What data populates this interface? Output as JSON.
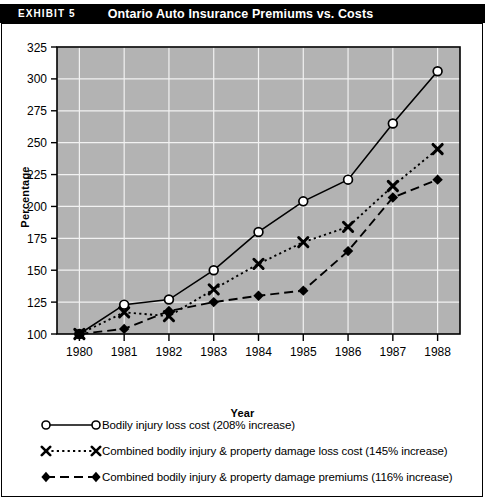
{
  "exhibit": {
    "label": "EXHIBIT 5",
    "title": "Ontario Auto Insurance Premiums vs. Costs"
  },
  "chart_data": {
    "type": "line",
    "title": "Ontario Auto Insurance Premiums vs. Costs",
    "xlabel": "Year",
    "ylabel": "Percentage",
    "categories": [
      1980,
      1981,
      1982,
      1983,
      1984,
      1985,
      1986,
      1987,
      1988
    ],
    "x": [
      "1980",
      "1981",
      "1982",
      "1983",
      "1984",
      "1985",
      "1986",
      "1987",
      "1988"
    ],
    "ylim": [
      100,
      325
    ],
    "yticks": [
      100,
      125,
      150,
      175,
      200,
      225,
      250,
      275,
      300,
      325
    ],
    "grid": true,
    "plot_background": "#b3b3b3",
    "legend_position": "below",
    "series": [
      {
        "name": "Bodily injury loss cost (208% increase)",
        "marker": "open-circle",
        "linestyle": "solid",
        "values": [
          100,
          123,
          127,
          150,
          180,
          204,
          221,
          265,
          306
        ]
      },
      {
        "name": "Combined bodily injury & property damage loss cost (145% increase)",
        "marker": "x-cross",
        "linestyle": "dotted",
        "values": [
          100,
          117,
          114,
          135,
          155,
          172,
          184,
          216,
          245
        ]
      },
      {
        "name": "Combined bodily injury & property damage premiums (116% increase)",
        "marker": "filled-diamond",
        "linestyle": "dashed",
        "values": [
          100,
          104,
          118,
          125,
          130,
          134,
          165,
          207,
          221
        ]
      }
    ]
  },
  "legend": [
    {
      "label": "Bodily injury loss cost (208% increase)",
      "marker": "open-circle",
      "linestyle": "solid"
    },
    {
      "label": "Combined bodily injury & property damage loss cost (145% increase)",
      "marker": "x-cross",
      "linestyle": "dotted"
    },
    {
      "label": "Combined bodily injury & property damage premiums (116% increase)",
      "marker": "filled-diamond",
      "linestyle": "dashed"
    }
  ],
  "axes": {
    "y_title": "Percentage",
    "x_title": "Year"
  }
}
